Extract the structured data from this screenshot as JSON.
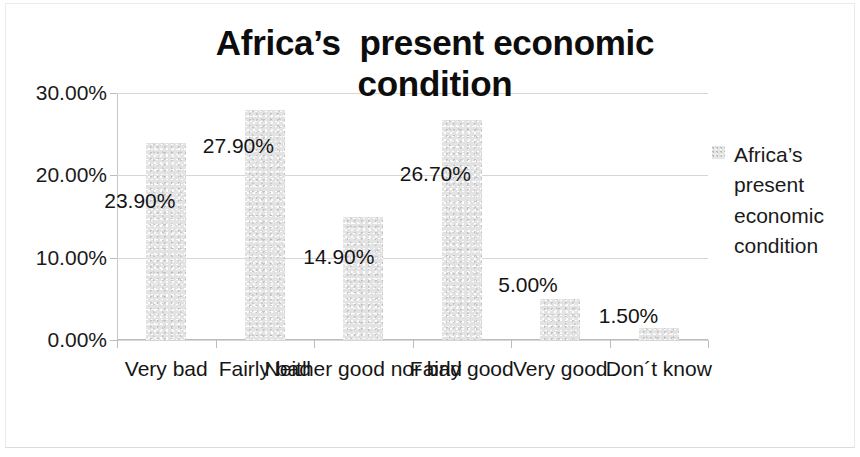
{
  "chart_data": {
    "type": "bar",
    "title": "Africa’s  present economic\ncondition",
    "xlabel": "",
    "ylabel": "",
    "categories": [
      "Very bad",
      "Fairly bad",
      "Neither good nor bad",
      "Fairly good",
      "Very good",
      "Don´t know"
    ],
    "values": [
      23.9,
      27.9,
      14.9,
      26.7,
      5.0,
      1.5
    ],
    "data_labels": [
      "23.90%",
      "27.90%",
      "14.90%",
      "26.70%",
      "5.00%",
      "1.50%"
    ],
    "ylim": [
      0,
      30
    ],
    "yticks": [
      0,
      10,
      20,
      30
    ],
    "ytick_labels": [
      "0.00%",
      "10.00%",
      "20.00%",
      "30.00%"
    ],
    "grid": true,
    "legend_position": "right",
    "series": [
      {
        "name": "Africa’s present economic condition",
        "values": [
          23.9,
          27.9,
          14.9,
          26.7,
          5.0,
          1.5
        ],
        "color": "#e3e3e3"
      }
    ],
    "legend": {
      "label_lines": [
        "Africa’s",
        "present",
        "economic",
        "condition"
      ],
      "swatch_color": "#e6e6e6"
    }
  },
  "colors": {
    "bar": "#e3e3e3",
    "grid": "#d6d6d6",
    "axis": "#bdbdbd",
    "text": "#141414",
    "background": "#ffffff"
  }
}
